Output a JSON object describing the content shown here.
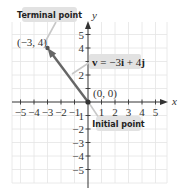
{
  "figure": {
    "x_axis_label": "x",
    "y_axis_label": "y",
    "x_ticks": [
      "−5",
      "−4",
      "−3",
      "−2",
      "−1",
      "1",
      "2",
      "3",
      "4",
      "5"
    ],
    "y_ticks_positive": [
      "1",
      "2",
      "4",
      "5"
    ],
    "y_ticks_negative": [
      "−2",
      "−3",
      "−4",
      "−5"
    ],
    "y_tick_neg1": "1",
    "terminal_point": {
      "callout": "Terminal point",
      "coords_label": "(−3, 4)",
      "x": -3,
      "y": 4
    },
    "initial_point": {
      "callout": "Initial point",
      "coords_label": "(0, 0)",
      "x": 0,
      "y": 0
    },
    "vector": {
      "name": "v",
      "equals": " = −3",
      "i": "i",
      "plus": " + 4",
      "j": "j",
      "color": "#666666"
    },
    "colors": {
      "grid": "#e4e4e4",
      "axis": "#333333",
      "callout_bg": "#e2e2e2",
      "callout_line": "#c8c8c8",
      "point": "#555555"
    }
  }
}
